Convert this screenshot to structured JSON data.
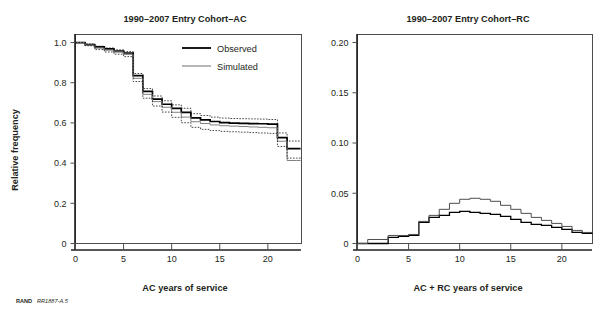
{
  "figure": {
    "credit_bold": "RAND",
    "credit_italic": "RR1887-A.5"
  },
  "chart_data": [
    {
      "id": "panel-ac",
      "type": "line",
      "title": "1990–2007 Entry Cohort–AC",
      "xlabel": "AC years of service",
      "ylabel": "Relative frequency",
      "xlim": [
        0,
        23.5
      ],
      "ylim": [
        0,
        1.04
      ],
      "xticks": [
        0,
        5,
        10,
        15,
        20
      ],
      "xticklabels": [
        "0",
        "5",
        "10",
        "15",
        "20"
      ],
      "yticks": [
        0,
        0.2,
        0.4,
        0.6,
        0.8,
        1.0
      ],
      "yticklabels": [
        "0",
        "0.2",
        "0.4",
        "0.6",
        "0.8",
        "1.0"
      ],
      "grid": false,
      "legend_position": "top-right",
      "legend": [
        {
          "name": "Observed",
          "style": "thick-black"
        },
        {
          "name": "Simulated",
          "style": "thin-gray"
        }
      ],
      "step_type": "post",
      "x": [
        0,
        1,
        2,
        3,
        4,
        5,
        6,
        7,
        8,
        9,
        10,
        11,
        12,
        13,
        14,
        15,
        16,
        17,
        18,
        19,
        20,
        21,
        22,
        23
      ],
      "series": [
        {
          "name": "Observed",
          "values": [
            1.0,
            0.99,
            0.978,
            0.968,
            0.958,
            0.948,
            0.835,
            0.757,
            0.718,
            0.693,
            0.672,
            0.652,
            0.625,
            0.615,
            0.607,
            0.601,
            0.599,
            0.598,
            0.597,
            0.596,
            0.594,
            0.527,
            0.472,
            0.472
          ]
        },
        {
          "name": "Simulated",
          "values": [
            1.0,
            0.988,
            0.972,
            0.962,
            0.952,
            0.941,
            0.822,
            0.742,
            0.706,
            0.678,
            0.653,
            0.629,
            0.606,
            0.597,
            0.59,
            0.586,
            0.584,
            0.582,
            0.58,
            0.578,
            0.576,
            0.509,
            0.413,
            0.413
          ]
        },
        {
          "name": "Simulated upper CI",
          "values": [
            1.0,
            0.993,
            0.982,
            0.973,
            0.964,
            0.955,
            0.846,
            0.771,
            0.734,
            0.71,
            0.69,
            0.673,
            0.646,
            0.637,
            0.629,
            0.624,
            0.622,
            0.621,
            0.62,
            0.619,
            0.617,
            0.55,
            0.51,
            0.51
          ]
        },
        {
          "name": "Simulated lower CI",
          "values": [
            1.0,
            0.984,
            0.965,
            0.953,
            0.942,
            0.93,
            0.806,
            0.723,
            0.684,
            0.654,
            0.628,
            0.601,
            0.578,
            0.568,
            0.562,
            0.558,
            0.556,
            0.554,
            0.552,
            0.55,
            0.548,
            0.483,
            0.425,
            0.425
          ]
        }
      ]
    },
    {
      "id": "panel-rc",
      "type": "line",
      "title": "1990–2007 Entry Cohort–RC",
      "xlabel": "AC + RC years of service",
      "ylabel": "",
      "xlim": [
        0,
        23.0
      ],
      "ylim": [
        0,
        0.208
      ],
      "xticks": [
        0,
        5,
        10,
        15,
        20
      ],
      "xticklabels": [
        "0",
        "5",
        "10",
        "15",
        "20"
      ],
      "yticks": [
        0,
        0.05,
        0.1,
        0.15,
        0.2
      ],
      "yticklabels": [
        "0",
        "0.05",
        "0.10",
        "0.15",
        "0.20"
      ],
      "grid": false,
      "legend_position": "none",
      "legend": [],
      "step_type": "post",
      "x": [
        0,
        1,
        2,
        3,
        4,
        5,
        6,
        7,
        8,
        9,
        10,
        11,
        12,
        13,
        14,
        15,
        16,
        17,
        18,
        19,
        20,
        21,
        22
      ],
      "series": [
        {
          "name": "Observed",
          "values": [
            0.0,
            0.0,
            0.0,
            0.006,
            0.007,
            0.008,
            0.021,
            0.026,
            0.028,
            0.031,
            0.032,
            0.031,
            0.03,
            0.029,
            0.027,
            0.024,
            0.021,
            0.019,
            0.018,
            0.016,
            0.014,
            0.011,
            0.01
          ]
        },
        {
          "name": "Simulated",
          "values": [
            0.0,
            0.004,
            0.004,
            0.008,
            0.008,
            0.009,
            0.022,
            0.028,
            0.034,
            0.04,
            0.044,
            0.045,
            0.044,
            0.042,
            0.038,
            0.034,
            0.03,
            0.026,
            0.023,
            0.02,
            0.017,
            0.013,
            0.011
          ]
        }
      ]
    }
  ]
}
